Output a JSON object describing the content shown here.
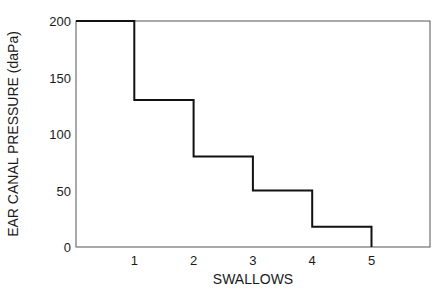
{
  "chart_data": {
    "type": "line",
    "subtype": "step",
    "title": "",
    "xlabel": "SWALLOWS",
    "ylabel": "EAR CANAL PRESSURE (daPa)",
    "x_ticks": [
      "1",
      "2",
      "3",
      "4",
      "5"
    ],
    "y_ticks": [
      "0",
      "50",
      "100",
      "150",
      "200"
    ],
    "xlim": [
      0,
      6
    ],
    "ylim": [
      0,
      200
    ],
    "grid": false,
    "legend": null,
    "series": [
      {
        "name": "Ear canal pressure",
        "x": [
          0,
          1,
          1,
          2,
          2,
          3,
          3,
          4,
          4,
          5,
          5
        ],
        "y": [
          200,
          200,
          130,
          130,
          80,
          80,
          50,
          50,
          18,
          18,
          0
        ]
      }
    ],
    "steps": [
      {
        "after_swallow": 0,
        "pressure": 200
      },
      {
        "after_swallow": 1,
        "pressure": 130
      },
      {
        "after_swallow": 2,
        "pressure": 80
      },
      {
        "after_swallow": 3,
        "pressure": 50
      },
      {
        "after_swallow": 4,
        "pressure": 18
      },
      {
        "after_swallow": 5,
        "pressure": 0
      }
    ]
  }
}
